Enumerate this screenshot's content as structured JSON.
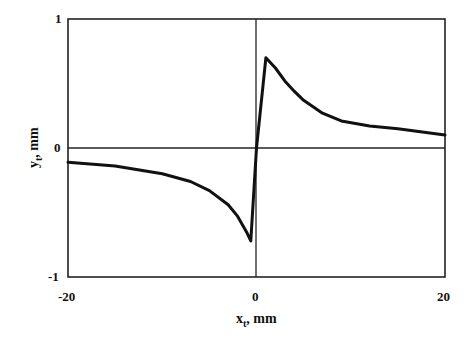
{
  "chart_data": {
    "type": "line",
    "title": "",
    "xlabel": "x_t, mm",
    "ylabel": "y_t, mm",
    "xlim": [
      -20,
      20
    ],
    "ylim": [
      -1,
      1
    ],
    "xticks": [
      "-20",
      "0",
      "20"
    ],
    "yticks": [
      "-1",
      "0",
      "1"
    ],
    "grid": false,
    "zero_lines": true,
    "series": [
      {
        "name": "y_t",
        "color": "#111111",
        "x": [
          -20,
          -15,
          -10,
          -7,
          -5,
          -3,
          -2,
          -1,
          -0.6,
          0,
          1,
          2,
          3,
          4,
          5,
          7,
          9,
          12,
          15,
          18,
          20
        ],
        "y": [
          -0.11,
          -0.14,
          -0.2,
          -0.26,
          -0.33,
          -0.44,
          -0.53,
          -0.66,
          -0.72,
          0.0,
          0.7,
          0.62,
          0.52,
          0.44,
          0.37,
          0.27,
          0.21,
          0.17,
          0.15,
          0.12,
          0.1
        ]
      }
    ]
  },
  "labels": {
    "x_main": "x",
    "x_sub": "t",
    "x_unit": ", mm",
    "y_main": "y",
    "y_sub": "t",
    "y_unit": ", mm",
    "xtick_min": "-20",
    "xtick_mid": "0",
    "xtick_max": "20",
    "ytick_max": "1",
    "ytick_mid": "0",
    "ytick_min": "-1"
  }
}
